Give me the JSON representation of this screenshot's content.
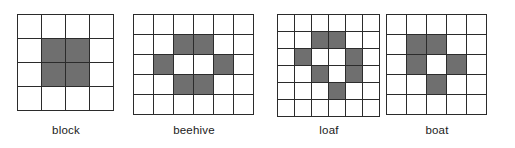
{
  "figure": {
    "background_color": "#ffffff",
    "line_color": "#2b2b2b",
    "alive_cell_color": "#6f6f6f",
    "dead_cell_color": "#ffffff",
    "caption_color": "#1a1a1a"
  },
  "patterns": [
    {
      "name": "block",
      "label": "block",
      "columns": 4,
      "rows": 4,
      "cell_size": 24,
      "left": 17,
      "top": 14,
      "caption_top": 124,
      "alive_cells": [
        [
          1,
          1
        ],
        [
          1,
          2
        ],
        [
          2,
          1
        ],
        [
          2,
          2
        ]
      ]
    },
    {
      "name": "beehive",
      "label": "beehive",
      "columns": 6,
      "rows": 5,
      "cell_size": 20,
      "left": 133,
      "top": 14,
      "caption_top": 124,
      "alive_cells": [
        [
          1,
          2
        ],
        [
          1,
          3
        ],
        [
          2,
          1
        ],
        [
          2,
          4
        ],
        [
          3,
          2
        ],
        [
          3,
          3
        ]
      ]
    },
    {
      "name": "loaf",
      "label": "loaf",
      "columns": 6,
      "rows": 6,
      "cell_size": 17,
      "left": 277,
      "top": 14,
      "caption_top": 124,
      "alive_cells": [
        [
          1,
          2
        ],
        [
          1,
          3
        ],
        [
          2,
          1
        ],
        [
          2,
          4
        ],
        [
          3,
          2
        ],
        [
          3,
          4
        ],
        [
          4,
          3
        ]
      ]
    },
    {
      "name": "boat",
      "label": "boat",
      "columns": 5,
      "rows": 5,
      "cell_size": 20,
      "left": 386,
      "top": 14,
      "caption_top": 124,
      "alive_cells": [
        [
          1,
          1
        ],
        [
          1,
          2
        ],
        [
          2,
          1
        ],
        [
          2,
          3
        ],
        [
          3,
          2
        ]
      ]
    }
  ]
}
